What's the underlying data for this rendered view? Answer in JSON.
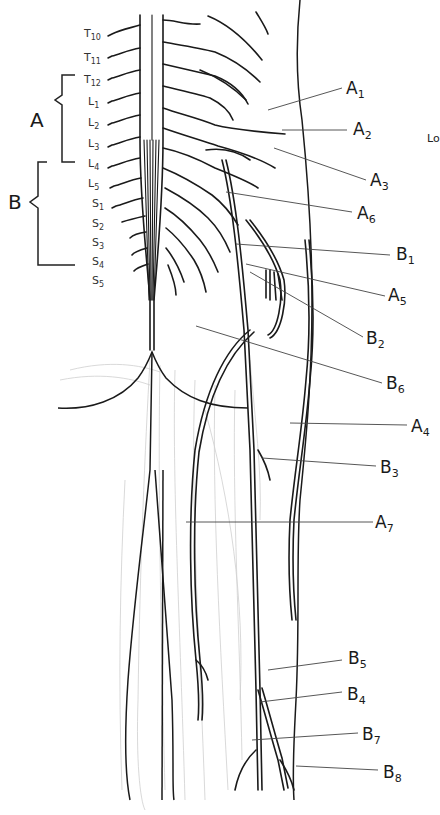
{
  "diagram": {
    "title_fragment": "Lo",
    "groups": [
      {
        "id": "A",
        "label": "A",
        "range": "T12–L4"
      },
      {
        "id": "B",
        "label": "B",
        "range": "L4–S4"
      }
    ],
    "segments": [
      {
        "letter": "T",
        "num": "10"
      },
      {
        "letter": "T",
        "num": "11"
      },
      {
        "letter": "T",
        "num": "12"
      },
      {
        "letter": "L",
        "num": "1"
      },
      {
        "letter": "L",
        "num": "2"
      },
      {
        "letter": "L",
        "num": "3"
      },
      {
        "letter": "L",
        "num": "4"
      },
      {
        "letter": "L",
        "num": "5"
      },
      {
        "letter": "S",
        "num": "1"
      },
      {
        "letter": "S",
        "num": "2"
      },
      {
        "letter": "S",
        "num": "3"
      },
      {
        "letter": "S",
        "num": "4"
      },
      {
        "letter": "S",
        "num": "5"
      }
    ],
    "callouts": [
      {
        "letter": "A",
        "num": "1"
      },
      {
        "letter": "A",
        "num": "2"
      },
      {
        "letter": "A",
        "num": "3"
      },
      {
        "letter": "A",
        "num": "6"
      },
      {
        "letter": "B",
        "num": "1"
      },
      {
        "letter": "A",
        "num": "5"
      },
      {
        "letter": "B",
        "num": "2"
      },
      {
        "letter": "B",
        "num": "6"
      },
      {
        "letter": "A",
        "num": "4"
      },
      {
        "letter": "B",
        "num": "3"
      },
      {
        "letter": "A",
        "num": "7"
      },
      {
        "letter": "B",
        "num": "5"
      },
      {
        "letter": "B",
        "num": "4"
      },
      {
        "letter": "B",
        "num": "7"
      },
      {
        "letter": "B",
        "num": "8"
      }
    ]
  }
}
